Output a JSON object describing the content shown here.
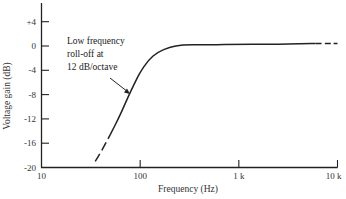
{
  "chart_data": {
    "type": "line",
    "title": "",
    "xlabel": "Frequency (Hz)",
    "ylabel": "Voltage gain (dB)",
    "xscale": "log",
    "xlim": [
      10,
      10000
    ],
    "ylim": [
      -20,
      6
    ],
    "x_ticks": [
      {
        "value": 10,
        "label": "10"
      },
      {
        "value": 100,
        "label": "100"
      },
      {
        "value": 1000,
        "label": "1 k"
      },
      {
        "value": 10000,
        "label": "10 k"
      }
    ],
    "y_ticks": [
      {
        "value": 4,
        "label": "+4"
      },
      {
        "value": 0,
        "label": "0"
      },
      {
        "value": -4,
        "label": "-4"
      },
      {
        "value": -8,
        "label": "-8"
      },
      {
        "value": -12,
        "label": "-12"
      },
      {
        "value": -16,
        "label": "-16"
      },
      {
        "value": -20,
        "label": "-20"
      }
    ],
    "grid": false,
    "series": [
      {
        "name": "Frequency response",
        "x": [
          35,
          40,
          50,
          60,
          70,
          80,
          90,
          100,
          120,
          150,
          200,
          250,
          300,
          400,
          500,
          1000,
          2000,
          5000,
          8000,
          10000
        ],
        "y": [
          -19,
          -17.5,
          -14.5,
          -12,
          -9.6,
          -7.5,
          -5.8,
          -4.3,
          -2.4,
          -1.0,
          -0.2,
          0.1,
          0.2,
          0.2,
          0.2,
          0.3,
          0.3,
          0.4,
          0.4,
          0.4
        ],
        "dashed_ranges": [
          [
            35,
            50
          ],
          [
            6000,
            10000
          ]
        ]
      }
    ],
    "annotations": [
      {
        "text": [
          "Low frequency",
          "roll-off at",
          "12 dB/octave"
        ],
        "points_to": {
          "x": 90,
          "y": -6
        }
      }
    ]
  }
}
